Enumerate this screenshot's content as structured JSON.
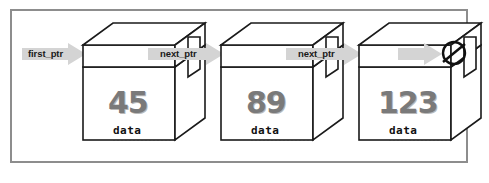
{
  "diagram": {
    "frame_border_color": "#8d8d8d",
    "arrow_color": "#d4d4d4",
    "value_color": "#7a7a7a",
    "outline_color": "#1a1a1a",
    "pointers": [
      {
        "label": "first_ptr",
        "name": "first-pointer"
      },
      {
        "label": "next_ptr",
        "name": "next-pointer-1"
      },
      {
        "label": "next_ptr",
        "name": "next-pointer-2"
      }
    ],
    "nodes": [
      {
        "value": "45",
        "field_label": "data"
      },
      {
        "value": "89",
        "field_label": "data"
      },
      {
        "value": "123",
        "field_label": "data"
      }
    ],
    "terminator": {
      "symbol": "Ø",
      "name": "null-symbol"
    }
  }
}
